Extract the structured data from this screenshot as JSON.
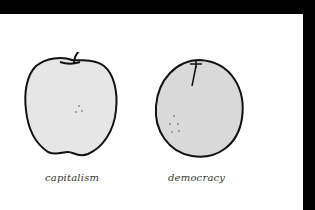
{
  "figures": [
    {
      "name": "apple",
      "caption": "capitalism",
      "fill": "#e6e6e6"
    },
    {
      "name": "orange",
      "caption": "democracy",
      "fill": "#d9d9d9"
    }
  ],
  "colors": {
    "frame": "#000000",
    "background": "#ffffff",
    "outline": "#111111"
  }
}
